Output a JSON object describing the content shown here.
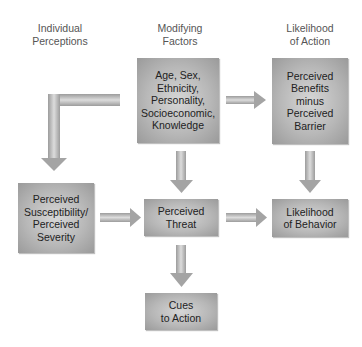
{
  "headers": {
    "col1": "Individual\nPerceptions",
    "col2": "Modifying\nFactors",
    "col3": "Likelihood\nof Action"
  },
  "boxes": {
    "modifying_factors": "Age, Sex,\nEthnicity,\nPersonality,\nSocioeconomic,\nKnowledge",
    "benefits_barrier": "Perceived\nBenefits\nminus\nPerceived\nBarrier",
    "susceptibility": "Perceived\nSusceptibility/\nPerceived\nSeverity",
    "threat": "Perceived\nThreat",
    "likelihood_behavior": "Likelihood\nof Behavior",
    "cues": "Cues\nto Action"
  },
  "arrows": [
    {
      "from": "modifying_factors",
      "to": "susceptibility",
      "shape": "elbow"
    },
    {
      "from": "modifying_factors",
      "to": "benefits_barrier",
      "shape": "right"
    },
    {
      "from": "modifying_factors",
      "to": "threat",
      "shape": "down"
    },
    {
      "from": "benefits_barrier",
      "to": "likelihood_behavior",
      "shape": "down"
    },
    {
      "from": "susceptibility",
      "to": "threat",
      "shape": "right"
    },
    {
      "from": "threat",
      "to": "likelihood_behavior",
      "shape": "right"
    },
    {
      "from": "threat",
      "to": "cues",
      "shape": "down"
    }
  ],
  "colors": {
    "box_fill": "#b8b8b8",
    "arrow_fill": "#a8a8a8",
    "header_text": "#555555"
  }
}
